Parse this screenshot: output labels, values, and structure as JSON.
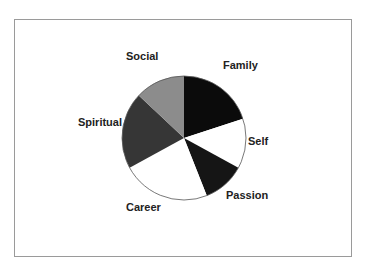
{
  "chart_data": {
    "type": "pie",
    "title": "",
    "start_angle_deg": 0,
    "direction": "clockwise",
    "categories": [
      "Family",
      "Self",
      "Passion",
      "Career",
      "Spiritual",
      "Social"
    ],
    "values": [
      20,
      13,
      11,
      23,
      20,
      13
    ],
    "unit": "percent (estimated from slice angles)",
    "colors": [
      "#0b0b0b",
      "#ffffff",
      "#151515",
      "#ffffff",
      "#363636",
      "#8c8c8c"
    ],
    "legend": "none",
    "labels_outside": true,
    "grid": false
  },
  "labels": {
    "family": "Family",
    "self": "Self",
    "passion": "Passion",
    "career": "Career",
    "spiritual": "Spiritual",
    "social": "Social"
  },
  "style": {
    "outline_color": "#555555",
    "frame_color": "#9a9a9a"
  }
}
